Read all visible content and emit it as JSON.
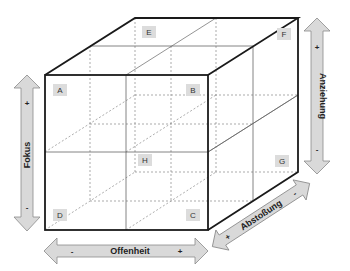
{
  "diagram": {
    "type": "3d-cube-matrix",
    "cells": {
      "A": "A",
      "B": "B",
      "C": "C",
      "D": "D",
      "E": "E",
      "F": "F",
      "G": "G",
      "H": "H"
    },
    "axes": {
      "vertical": {
        "label": "Fokus",
        "plus": "+",
        "minus": "-"
      },
      "horizontal": {
        "label": "Offenheit",
        "minus": "-",
        "plus": "+"
      },
      "depth": {
        "label": "Abstoßung",
        "plus": "+",
        "minus": "-"
      },
      "right_vertical": {
        "label": "Anziehung",
        "plus": "+",
        "minus": "-"
      }
    },
    "colors": {
      "edge": "#1a1a1a",
      "grid": "#555555",
      "dashed": "#777777",
      "label_box": "#dcdcdc",
      "arrow_fill": "#d9d9d9",
      "arrow_stroke": "#8a8a8a"
    }
  }
}
